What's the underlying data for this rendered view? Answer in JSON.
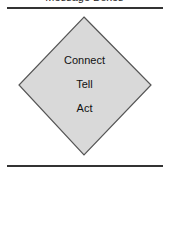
{
  "header": {
    "title_clipped": "Message Boxes"
  },
  "diagram": {
    "shape": "diamond",
    "fill": "#d9d9d9",
    "stroke": "#555555",
    "labels": [
      "Connect",
      "Tell",
      "Act"
    ]
  }
}
